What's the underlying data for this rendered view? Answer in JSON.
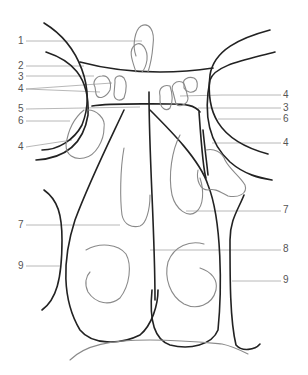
{
  "figure": {
    "type": "anatomical line drawing",
    "colors": {
      "outline": "#222222",
      "inner": "#8a8a8a",
      "leader": "#b0b0b0",
      "label": "#555555"
    },
    "labels_left": [
      {
        "id": "l1",
        "text": "1",
        "x": 18,
        "y": 36
      },
      {
        "id": "l2",
        "text": "2",
        "x": 18,
        "y": 61
      },
      {
        "id": "l3",
        "text": "3",
        "x": 18,
        "y": 72
      },
      {
        "id": "l4a",
        "text": "4",
        "x": 18,
        "y": 84
      },
      {
        "id": "l5",
        "text": "5",
        "x": 18,
        "y": 104
      },
      {
        "id": "l6",
        "text": "6",
        "x": 18,
        "y": 116
      },
      {
        "id": "l4b",
        "text": "4",
        "x": 18,
        "y": 142
      },
      {
        "id": "l7",
        "text": "7",
        "x": 18,
        "y": 220
      },
      {
        "id": "l9",
        "text": "9",
        "x": 18,
        "y": 261
      }
    ],
    "labels_right": [
      {
        "id": "r4a",
        "text": "4",
        "x": 283,
        "y": 90
      },
      {
        "id": "r3",
        "text": "3",
        "x": 283,
        "y": 103
      },
      {
        "id": "r6",
        "text": "6",
        "x": 283,
        "y": 114
      },
      {
        "id": "r4b",
        "text": "4",
        "x": 283,
        "y": 138
      },
      {
        "id": "r7",
        "text": "7",
        "x": 283,
        "y": 205
      },
      {
        "id": "r8",
        "text": "8",
        "x": 283,
        "y": 244
      },
      {
        "id": "r9",
        "text": "9",
        "x": 283,
        "y": 275
      }
    ]
  }
}
